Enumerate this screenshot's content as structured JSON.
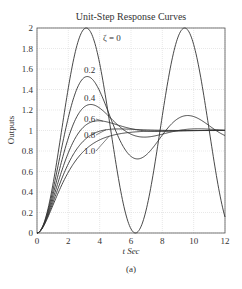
{
  "chart_data": {
    "type": "line",
    "title": "Unit-Step Response Curves",
    "xlabel": "t Sec",
    "ylabel": "Outputs",
    "caption": "(a)",
    "xlim": [
      0,
      12
    ],
    "ylim": [
      0,
      2
    ],
    "xticks": [
      0,
      2,
      4,
      6,
      8,
      10,
      12
    ],
    "yticks": [
      0,
      0.2,
      0.4,
      0.6,
      0.8,
      1,
      1.2,
      1.4,
      1.6,
      1.8,
      2
    ],
    "ytick_labels": [
      "0",
      "0.2",
      "0.4",
      "0.6",
      "0.8",
      "1",
      "1.2",
      "1.4",
      "1.6",
      "1.8",
      "2"
    ],
    "grid": true,
    "legend": "inline labels",
    "omega_n": 1,
    "series": [
      {
        "name": "ζ = 0",
        "zeta": 0.0,
        "label_pos": [
          103,
          41
        ]
      },
      {
        "name": "0.2",
        "zeta": 0.2,
        "label_pos": [
          84,
          73
        ]
      },
      {
        "name": "0.4",
        "zeta": 0.4,
        "label_pos": [
          84,
          101
        ]
      },
      {
        "name": "0.6",
        "zeta": 0.6,
        "label_pos": [
          84,
          122
        ]
      },
      {
        "name": "0.8",
        "zeta": 0.8,
        "label_pos": [
          84,
          138
        ]
      },
      {
        "name": "1.0",
        "zeta": 1.0,
        "label_pos": [
          84,
          154
        ]
      }
    ],
    "label_leaders": [
      {
        "zeta": 0.6,
        "from": [
          96,
          119
        ],
        "to_t": 4.2
      },
      {
        "zeta": 0.8,
        "from": [
          96,
          135
        ],
        "to_t": 4.4
      },
      {
        "zeta": 1.0,
        "from": [
          96,
          151
        ],
        "to_t": 4.6
      }
    ],
    "colors": {
      "curve": "#333333",
      "grid": "#d0d0d0",
      "axis": "#555555"
    }
  }
}
